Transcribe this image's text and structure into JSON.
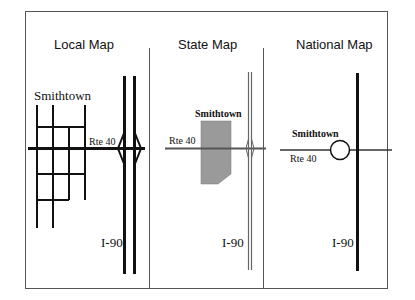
{
  "panels": [
    {
      "title": "Local Map",
      "town_label": "Smithtown",
      "road_label": "Rte 40",
      "highway_label": "I-90"
    },
    {
      "title": "State Map",
      "town_label": "Smithtown",
      "road_label": "Rte 40",
      "highway_label": "I-90"
    },
    {
      "title": "National Map",
      "town_label": "Smithtown",
      "road_label": "Rte 40",
      "highway_label": "I-90"
    }
  ],
  "colors": {
    "frame": "#555555",
    "road": "#111111",
    "town_fill": "#9a9a9a",
    "state_road": "#666666"
  }
}
